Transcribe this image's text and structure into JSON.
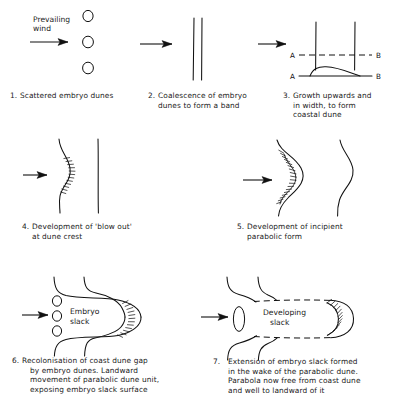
{
  "figure": {
    "title_text": "Prevailing wind",
    "wind_label_line1": "Prevailing",
    "wind_label_line2": "wind",
    "ab_left": "A",
    "ab_right": "B",
    "embryo_slack_line1": "Embryo",
    "embryo_slack_line2": "slack",
    "developing_slack_line1": "Developing",
    "developing_slack_line2": "slack",
    "ink_color": "#111111",
    "background_color": "#ffffff"
  },
  "stages": [
    {
      "number": "1.",
      "caption_lines": [
        "Scattered embryo dunes"
      ],
      "name": "scattered-embryo-dunes"
    },
    {
      "number": "2.",
      "caption_lines": [
        "Coalescence of embryo",
        "dunes to form a band"
      ],
      "name": "coalescence-band"
    },
    {
      "number": "3.",
      "caption_lines": [
        "Growth upwards and",
        "in width, to form",
        "coastal dune"
      ],
      "name": "growth-coastal-dune"
    },
    {
      "number": "4.",
      "caption_lines": [
        "Development of 'blow out'",
        "at dune crest"
      ],
      "name": "blow-out"
    },
    {
      "number": "5.",
      "caption_lines": [
        "Development of incipient",
        "parabolic form"
      ],
      "name": "incipient-parabolic"
    },
    {
      "number": "6.",
      "caption_lines": [
        "Recolonisation of coast dune gap",
        "by embryo dunes. Landward",
        "movement of parabolic dune unit,",
        "exposing embryo slack surface"
      ],
      "name": "recolonisation"
    },
    {
      "number": "7.",
      "caption_lines": [
        "Extension of embryo slack formed",
        "in the wake of the parabolic dune.",
        "Parabola now free from coast dune",
        "and well to landward of it"
      ],
      "name": "extension-slack"
    }
  ]
}
